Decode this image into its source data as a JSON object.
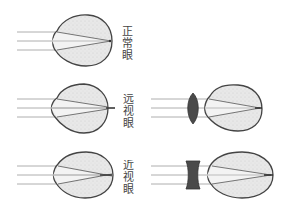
{
  "diagram": {
    "colors": {
      "outline": "#444444",
      "ray": "#888888",
      "eye_fill": "#e6e6e6",
      "cone_fill": "#f4f4f4",
      "lens_fill": "#4a4a4a",
      "label": "#444444"
    },
    "rows": [
      {
        "id": "normal",
        "label": "正常眼",
        "chars": [
          "正",
          "常",
          "眼"
        ],
        "lens": "none",
        "focus": "on-retina"
      },
      {
        "id": "hyperopia",
        "label": "远视眼",
        "chars": [
          "远",
          "视",
          "眼"
        ],
        "lens": "convex",
        "focus": "behind-retina"
      },
      {
        "id": "myopia",
        "label": "近视眼",
        "chars": [
          "近",
          "视",
          "眼"
        ],
        "lens": "concave",
        "focus": "in-front-of-retina"
      }
    ]
  }
}
